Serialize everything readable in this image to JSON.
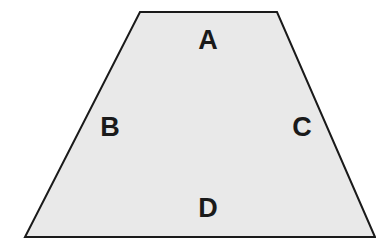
{
  "canvas": {
    "width": 376,
    "height": 245,
    "background_color": "#ffffff"
  },
  "figure": {
    "name": "trapezoid",
    "fill_color": "#e9e9e9",
    "stroke_color": "#1a1a1a",
    "stroke_width": 2,
    "vertices": [
      {
        "name": "top-left",
        "x": 140,
        "y": 12
      },
      {
        "name": "top-right",
        "x": 277,
        "y": 12
      },
      {
        "name": "bottom-right",
        "x": 375,
        "y": 237
      },
      {
        "name": "bottom-left",
        "x": 25,
        "y": 237
      }
    ],
    "points_string": "140,12 277,12 375,237 25,237"
  },
  "labels": {
    "a": "A",
    "b": "B",
    "c": "C",
    "d": "D"
  }
}
